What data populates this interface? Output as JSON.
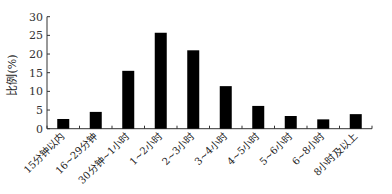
{
  "chart_data": {
    "type": "bar",
    "title": "",
    "xlabel": "",
    "ylabel": "比例(%)",
    "ylim": [
      0,
      30
    ],
    "yticks": [
      0,
      5,
      10,
      15,
      20,
      25,
      30
    ],
    "grid": false,
    "legend": null,
    "categories": [
      "15分钟以内",
      "16~29分钟",
      "30分钟~1小时",
      "1~2小时",
      "2~3小时",
      "3~4小时",
      "4~5小时",
      "5~6小时",
      "6~8小时",
      "8小时及以上"
    ],
    "values": [
      2.6,
      4.5,
      15.5,
      25.7,
      21.0,
      11.4,
      6.1,
      3.4,
      2.5,
      3.9
    ],
    "bar_color": "#000000"
  }
}
